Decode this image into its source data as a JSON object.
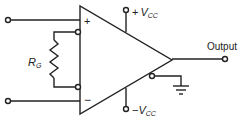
{
  "diagram": {
    "type": "op-amp circuit",
    "labels": {
      "plus_input": "+",
      "minus_input": "−",
      "gain_resistor_main": "R",
      "gain_resistor_sub": "G",
      "pos_supply_sign": "+",
      "pos_supply_main": "V",
      "pos_supply_sub": "CC",
      "neg_supply_sign": "−",
      "neg_supply_main": "V",
      "neg_supply_sub": "CC",
      "output": "Output"
    },
    "colors": {
      "stroke": "#222222",
      "background": "#ffffff"
    }
  }
}
